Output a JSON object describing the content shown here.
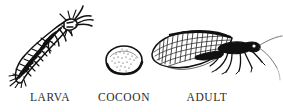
{
  "figure": {
    "background_color": "#ffffff",
    "ink_color": "#1a1a1a",
    "caption_color": "#2b2b2b",
    "stages": [
      {
        "id": "larva",
        "label": "LARVA",
        "icon_name": "lacewing-larva-illustration",
        "description": "Segmented spiny larva oriented diagonally, head with mandibles at upper right"
      },
      {
        "id": "cocoon",
        "label": "COCOON",
        "icon_name": "lacewing-cocoon-illustration",
        "description": "Rounded oval stippled cocoon with dark lower-right outline"
      },
      {
        "id": "adult",
        "label": "ADULT",
        "icon_name": "lacewing-adult-illustration",
        "description": "Adult lacewing in side view with large veined wing, legs and two long antennae sweeping right"
      }
    ]
  }
}
